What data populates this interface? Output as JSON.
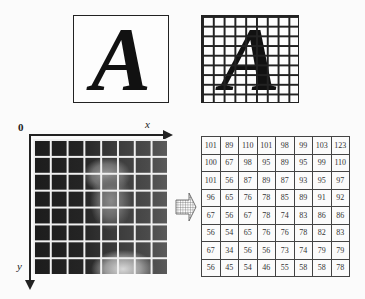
{
  "top_row": {
    "glyph": "A",
    "box1": {
      "label": "continuous letter A"
    },
    "box2": {
      "label": "letter A with sampling grid",
      "grid_cols": 9,
      "grid_rows": 9
    }
  },
  "image_axes": {
    "origin": "0",
    "x_label": "x",
    "y_label": "y",
    "photo_grid": {
      "cols": 8,
      "rows": 8
    }
  },
  "matrix": {
    "rows": [
      [
        101,
        89,
        110,
        101,
        98,
        99,
        103,
        123
      ],
      [
        100,
        67,
        98,
        95,
        89,
        95,
        99,
        110
      ],
      [
        101,
        56,
        87,
        89,
        87,
        93,
        95,
        97
      ],
      [
        96,
        65,
        76,
        78,
        85,
        89,
        91,
        92
      ],
      [
        67,
        56,
        67,
        78,
        74,
        83,
        86,
        86
      ],
      [
        56,
        54,
        65,
        76,
        76,
        78,
        82,
        83
      ],
      [
        67,
        34,
        56,
        56,
        73,
        74,
        79,
        79
      ],
      [
        56,
        45,
        54,
        46,
        55,
        58,
        58,
        78
      ]
    ]
  }
}
